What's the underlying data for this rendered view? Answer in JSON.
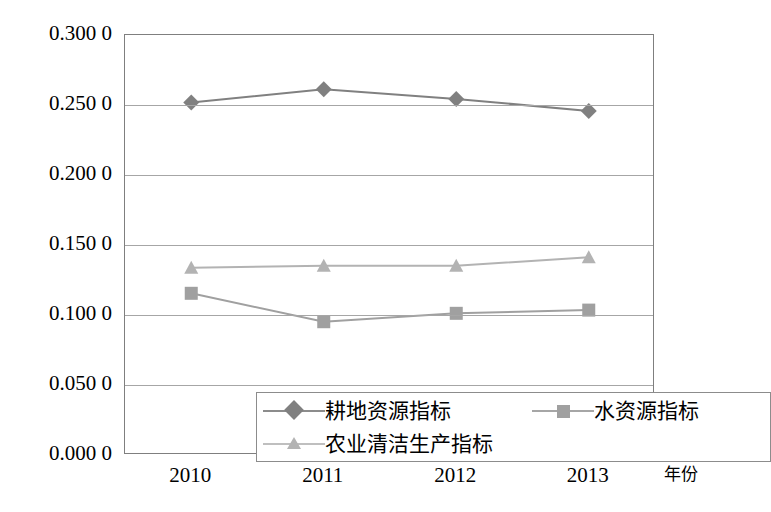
{
  "chart_data": {
    "type": "line",
    "title": "",
    "xlabel": "年份",
    "ylabel": "",
    "categories": [
      "2010",
      "2011",
      "2012",
      "2013"
    ],
    "ylim": [
      0.0,
      0.3
    ],
    "yticks": [
      "0.000 0",
      "0.050 0",
      "0.100 0",
      "0.150 0",
      "0.200 0",
      "0.250 0",
      "0.300 0"
    ],
    "ytick_values": [
      0.0,
      0.05,
      0.1,
      0.15,
      0.2,
      0.25,
      0.3
    ],
    "grid": "horizontal",
    "legend_position": "inside-bottom-left",
    "series": [
      {
        "name": "耕地资源指标",
        "marker": "diamond",
        "color": "#808080",
        "values": [
          0.2518,
          0.2612,
          0.2543,
          0.2458
        ]
      },
      {
        "name": "水资源指标",
        "marker": "square",
        "color": "#a0a0a0",
        "values": [
          0.1155,
          0.0952,
          0.1012,
          0.1035
        ]
      },
      {
        "name": "农业清洁生产指标",
        "marker": "triangle",
        "color": "#b3b3b3",
        "values": [
          0.1338,
          0.1352,
          0.1352,
          0.1412
        ]
      }
    ]
  },
  "legend": {
    "items": [
      {
        "label": "耕地资源指标",
        "marker": "diamond-marker-icon"
      },
      {
        "label": "水资源指标",
        "marker": "square-marker-icon"
      },
      {
        "label": "农业清洁生产指标",
        "marker": "triangle-marker-icon"
      }
    ]
  },
  "axis": {
    "x_title": "年份"
  },
  "caption": {
    "text": ""
  }
}
